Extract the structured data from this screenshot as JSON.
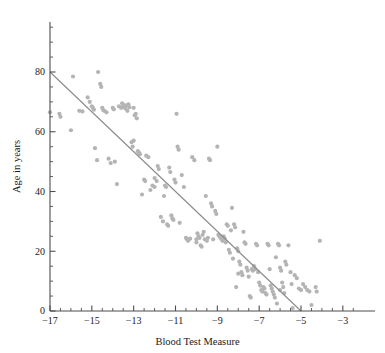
{
  "chart_data": {
    "type": "scatter",
    "title": "",
    "xlabel": "Blood Test Measure",
    "ylabel": "Age in years",
    "xlim": [
      -17.6,
      -2.2
    ],
    "ylim": [
      0,
      95
    ],
    "grid": false,
    "legend": "none",
    "x_major_ticks": [
      -17,
      -15,
      -13,
      -11,
      -9,
      -7,
      -5,
      -3
    ],
    "x_major_tick_labels": [
      "−17",
      "−15",
      "−13",
      "−11",
      "−9",
      "−7",
      "−5",
      "−3"
    ],
    "x_minor_tick_step": 0.5,
    "y_major_ticks": [
      0,
      20,
      40,
      60,
      80
    ],
    "y_major_tick_labels": [
      "0",
      "20",
      "40",
      "60",
      "80"
    ],
    "y_minor_tick_step": 5,
    "marker": {
      "shape": "circle",
      "color": "#b4b4b4",
      "size_px": 2.1
    },
    "series": [
      {
        "name": "observations",
        "points": [
          [
            -17.0,
            66.5
          ],
          [
            -16.55,
            66.0
          ],
          [
            -16.5,
            65.0
          ],
          [
            -16.0,
            60.5
          ],
          [
            -15.9,
            78.5
          ],
          [
            -15.6,
            67.0
          ],
          [
            -15.45,
            66.8
          ],
          [
            -15.2,
            71.5
          ],
          [
            -15.1,
            70.0
          ],
          [
            -15.0,
            68.5
          ],
          [
            -14.95,
            68.0
          ],
          [
            -14.9,
            67.4
          ],
          [
            -14.85,
            54.5
          ],
          [
            -14.75,
            50.5
          ],
          [
            -14.7,
            80.0
          ],
          [
            -14.6,
            76.0
          ],
          [
            -14.55,
            75.0
          ],
          [
            -14.5,
            68.0
          ],
          [
            -14.45,
            67.2
          ],
          [
            -14.4,
            67.0
          ],
          [
            -14.3,
            66.5
          ],
          [
            -14.2,
            51.0
          ],
          [
            -14.1,
            49.5
          ],
          [
            -14.0,
            68.0
          ],
          [
            -13.95,
            67.5
          ],
          [
            -13.9,
            50.0
          ],
          [
            -13.8,
            42.5
          ],
          [
            -13.7,
            68.5
          ],
          [
            -13.6,
            68.0
          ],
          [
            -13.55,
            69.5
          ],
          [
            -13.5,
            69.0
          ],
          [
            -13.45,
            68.4
          ],
          [
            -13.4,
            67.8
          ],
          [
            -13.35,
            68.8
          ],
          [
            -13.3,
            67.0
          ],
          [
            -13.25,
            69.2
          ],
          [
            -13.2,
            68.2
          ],
          [
            -13.1,
            56.5
          ],
          [
            -13.05,
            55.0
          ],
          [
            -13.0,
            57.0
          ],
          [
            -12.95,
            65.5
          ],
          [
            -12.9,
            66.0
          ],
          [
            -12.85,
            64.5
          ],
          [
            -12.8,
            53.5
          ],
          [
            -12.75,
            53.0
          ],
          [
            -12.7,
            52.5
          ],
          [
            -12.6,
            39.0
          ],
          [
            -12.5,
            44.0
          ],
          [
            -12.45,
            43.5
          ],
          [
            -12.4,
            52.0
          ],
          [
            -12.3,
            51.5
          ],
          [
            -12.2,
            40.5
          ],
          [
            -12.1,
            42.0
          ],
          [
            -12.0,
            41.5
          ],
          [
            -11.9,
            43.5
          ],
          [
            -11.85,
            48.5
          ],
          [
            -11.8,
            47.5
          ],
          [
            -11.7,
            31.5
          ],
          [
            -11.6,
            30.0
          ],
          [
            -11.55,
            38.5
          ],
          [
            -11.5,
            42.0
          ],
          [
            -11.45,
            41.5
          ],
          [
            -11.4,
            29.0
          ],
          [
            -11.35,
            28.5
          ],
          [
            -11.3,
            48.0
          ],
          [
            -11.25,
            46.5
          ],
          [
            -11.2,
            32.0
          ],
          [
            -11.15,
            31.0
          ],
          [
            -11.1,
            30.5
          ],
          [
            -11.05,
            44.0
          ],
          [
            -11.0,
            43.0
          ],
          [
            -10.95,
            66.0
          ],
          [
            -10.9,
            55.0
          ],
          [
            -10.85,
            54.0
          ],
          [
            -10.8,
            29.5
          ],
          [
            -10.7,
            45.5
          ],
          [
            -10.6,
            41.5
          ],
          [
            -10.5,
            24.5
          ],
          [
            -10.45,
            24.0
          ],
          [
            -10.4,
            23.5
          ],
          [
            -10.3,
            24.2
          ],
          [
            -10.2,
            51.5
          ],
          [
            -10.1,
            50.5
          ],
          [
            -10.0,
            24.0
          ],
          [
            -9.95,
            26.0
          ],
          [
            -9.9,
            25.0
          ],
          [
            -9.85,
            24.5
          ],
          [
            -9.8,
            22.0
          ],
          [
            -9.75,
            21.5
          ],
          [
            -9.7,
            25.5
          ],
          [
            -9.65,
            26.5
          ],
          [
            -9.6,
            24.0
          ],
          [
            -9.55,
            38.5
          ],
          [
            -9.5,
            23.5
          ],
          [
            -9.45,
            24.5
          ],
          [
            -9.4,
            51.0
          ],
          [
            -9.35,
            50.5
          ],
          [
            -9.3,
            36.0
          ],
          [
            -9.25,
            35.0
          ],
          [
            -9.2,
            24.0
          ],
          [
            -9.1,
            33.5
          ],
          [
            -9.05,
            32.5
          ],
          [
            -9.0,
            55.0
          ],
          [
            -8.95,
            25.5
          ],
          [
            -8.9,
            25.0
          ],
          [
            -8.85,
            24.5
          ],
          [
            -8.8,
            24.0
          ],
          [
            -8.75,
            23.5
          ],
          [
            -8.7,
            25.0
          ],
          [
            -8.65,
            24.2
          ],
          [
            -8.6,
            23.0
          ],
          [
            -8.55,
            29.0
          ],
          [
            -8.5,
            28.5
          ],
          [
            -8.45,
            20.5
          ],
          [
            -8.4,
            19.5
          ],
          [
            -8.35,
            27.0
          ],
          [
            -8.3,
            34.5
          ],
          [
            -8.25,
            17.5
          ],
          [
            -8.2,
            29.0
          ],
          [
            -8.15,
            28.0
          ],
          [
            -8.1,
            8.0
          ],
          [
            -8.05,
            21.0
          ],
          [
            -8.0,
            20.0
          ],
          [
            -7.95,
            16.5
          ],
          [
            -7.9,
            15.5
          ],
          [
            -7.85,
            13.0
          ],
          [
            -7.8,
            12.0
          ],
          [
            -7.75,
            26.5
          ],
          [
            -7.7,
            23.0
          ],
          [
            -7.65,
            22.5
          ],
          [
            -7.6,
            14.5
          ],
          [
            -7.55,
            13.5
          ],
          [
            -7.5,
            11.5
          ],
          [
            -7.45,
            5.0
          ],
          [
            -7.4,
            4.5
          ],
          [
            -7.35,
            14.0
          ],
          [
            -7.3,
            13.5
          ],
          [
            -7.25,
            15.0
          ],
          [
            -7.2,
            14.0
          ],
          [
            -7.15,
            22.5
          ],
          [
            -7.1,
            22.0
          ],
          [
            -7.05,
            13.0
          ],
          [
            -7.0,
            9.5
          ],
          [
            -6.95,
            8.5
          ],
          [
            -6.9,
            7.0
          ],
          [
            -6.85,
            6.5
          ],
          [
            -6.8,
            8.0
          ],
          [
            -6.75,
            7.5
          ],
          [
            -6.7,
            6.0
          ],
          [
            -6.65,
            5.5
          ],
          [
            -6.6,
            22.5
          ],
          [
            -6.55,
            22.0
          ],
          [
            -6.5,
            14.0
          ],
          [
            -6.45,
            8.5
          ],
          [
            -6.4,
            7.5
          ],
          [
            -6.35,
            6.5
          ],
          [
            -6.3,
            5.5
          ],
          [
            -6.25,
            4.5
          ],
          [
            -6.2,
            18.0
          ],
          [
            -6.15,
            2.5
          ],
          [
            -6.1,
            22.5
          ],
          [
            -6.05,
            22.0
          ],
          [
            -6.0,
            14.5
          ],
          [
            -5.95,
            13.5
          ],
          [
            -5.9,
            9.5
          ],
          [
            -5.85,
            8.0
          ],
          [
            -5.8,
            6.0
          ],
          [
            -5.75,
            16.5
          ],
          [
            -5.7,
            15.5
          ],
          [
            -5.6,
            22.0
          ],
          [
            -5.5,
            13.0
          ],
          [
            -5.45,
            9.0
          ],
          [
            -5.4,
            1.0
          ],
          [
            -5.3,
            12.0
          ],
          [
            -5.2,
            11.0
          ],
          [
            -5.1,
            7.5
          ],
          [
            -5.0,
            7.0
          ],
          [
            -4.9,
            9.0
          ],
          [
            -4.8,
            8.0
          ],
          [
            -4.7,
            7.0
          ],
          [
            -4.6,
            6.5
          ],
          [
            -4.5,
            2.0
          ],
          [
            -4.3,
            8.0
          ],
          [
            -4.25,
            6.5
          ],
          [
            -4.1,
            23.5
          ],
          [
            -13.0,
            68.0
          ],
          [
            -12.0,
            44.5
          ],
          [
            -10.0,
            23.0
          ],
          [
            -8.0,
            12.5
          ],
          [
            -6.0,
            7.0
          ]
        ]
      }
    ],
    "fit_line": {
      "name": "regression-line",
      "color": "#8c8c8c",
      "start": [
        -17,
        80
      ],
      "end": [
        -5,
        0
      ],
      "slope": -6.667,
      "intercept": -33.33
    }
  }
}
